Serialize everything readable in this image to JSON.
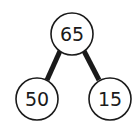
{
  "diagram": {
    "type": "number-bond",
    "nodes": [
      {
        "id": "whole",
        "label": "65",
        "cx": 72,
        "cy": 34,
        "r": 21
      },
      {
        "id": "part-left",
        "label": "50",
        "cx": 37,
        "cy": 99,
        "r": 21
      },
      {
        "id": "part-right",
        "label": "15",
        "cx": 110,
        "cy": 99,
        "r": 21
      }
    ],
    "edges": [
      {
        "from": "whole",
        "to": "part-left"
      },
      {
        "from": "whole",
        "to": "part-right"
      }
    ],
    "colors": {
      "stroke": "#1a1a1a",
      "fill": "#ffffff"
    }
  }
}
